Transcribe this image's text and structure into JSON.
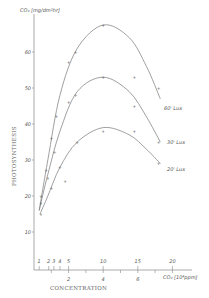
{
  "chart_data": {
    "type": "line",
    "title": "",
    "ylabel_unit": "CO₂ [mg/dm²hr]",
    "ylabel": "PHOTOSYNTHESIS",
    "xlabel": "CONCENTRATION",
    "xlabel_unit": "CO₂ [10⁴ppm]",
    "yticks": [
      10,
      20,
      30,
      40,
      50,
      60
    ],
    "xticks_primary": [
      2,
      4,
      6
    ],
    "xticks_secondary": [
      "1",
      "2",
      "3",
      "4",
      "5",
      "10",
      "15",
      "20"
    ],
    "xlim": [
      0,
      9
    ],
    "ylim": [
      0,
      70
    ],
    "grid": false,
    "legend_position": "inline-right",
    "series": [
      {
        "name": "60' Lux",
        "curve": [
          [
            0.3,
            16
          ],
          [
            0.8,
            30
          ],
          [
            1.5,
            48
          ],
          [
            2.5,
            61
          ],
          [
            4.0,
            67.5
          ],
          [
            5.5,
            64
          ],
          [
            6.5,
            56
          ],
          [
            7.3,
            47
          ]
        ],
        "points": [
          [
            0.4,
            20
          ],
          [
            0.7,
            27
          ],
          [
            1.0,
            36
          ],
          [
            1.3,
            42
          ],
          [
            2.0,
            57
          ],
          [
            2.4,
            60
          ],
          [
            4.0,
            67.5
          ],
          [
            7.2,
            50
          ]
        ]
      },
      {
        "name": "30' Lux",
        "curve": [
          [
            0.3,
            16
          ],
          [
            0.8,
            26
          ],
          [
            1.5,
            38
          ],
          [
            2.5,
            49
          ],
          [
            4.0,
            53
          ],
          [
            5.5,
            49
          ],
          [
            6.5,
            42
          ],
          [
            7.3,
            35
          ]
        ],
        "points": [
          [
            0.4,
            18
          ],
          [
            0.8,
            25
          ],
          [
            1.2,
            32
          ],
          [
            2.0,
            46
          ],
          [
            2.4,
            48
          ],
          [
            4.0,
            53
          ],
          [
            5.8,
            53
          ],
          [
            5.8,
            45
          ],
          [
            7.2,
            35
          ]
        ]
      },
      {
        "name": "20' Lux",
        "curve": [
          [
            0.35,
            15
          ],
          [
            0.8,
            20
          ],
          [
            1.5,
            28
          ],
          [
            2.5,
            35
          ],
          [
            4.0,
            39
          ],
          [
            5.5,
            37
          ],
          [
            6.5,
            33
          ],
          [
            7.3,
            29
          ]
        ],
        "points": [
          [
            0.4,
            15
          ],
          [
            1.0,
            22
          ],
          [
            1.5,
            28
          ],
          [
            1.8,
            24
          ],
          [
            2.5,
            35
          ],
          [
            4.0,
            38
          ],
          [
            5.8,
            38
          ],
          [
            7.2,
            29
          ]
        ]
      }
    ]
  },
  "labels": {
    "y_unit": "CO₂ [mg/dm²hr]",
    "y_title": "PHOTOSYNTHESIS",
    "x_title": "CONCENTRATION",
    "x_unit": "CO₂ [10⁴ppm]",
    "y_ticks": [
      "10",
      "20",
      "30",
      "40",
      "50",
      "60"
    ],
    "x_ticks": [
      "2",
      "4",
      "6"
    ],
    "x_secondary": [
      "1",
      "2",
      "3",
      "4",
      "5",
      "10",
      "15",
      "20"
    ],
    "series": [
      "60' Lux",
      "30' Lux",
      "20' Lux"
    ]
  }
}
